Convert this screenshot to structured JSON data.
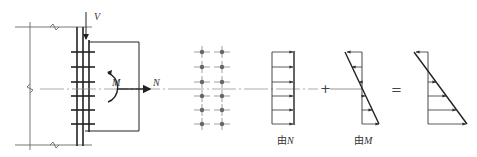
{
  "diagram": {
    "colors": {
      "line": "#222222",
      "thin": "#555555",
      "center": "#888888",
      "bolt": "#666666"
    },
    "connection": {
      "force_V": "V",
      "moment_M": "M",
      "force_N": "N"
    },
    "bolt_rows": 6,
    "bolt_cols": 2,
    "stress_from_N": {
      "label": "由N",
      "prefix": "由",
      "var": "N"
    },
    "operator_plus": "+",
    "stress_from_M": {
      "label": "由M",
      "prefix": "由",
      "var": "M"
    },
    "operator_equals": "="
  }
}
